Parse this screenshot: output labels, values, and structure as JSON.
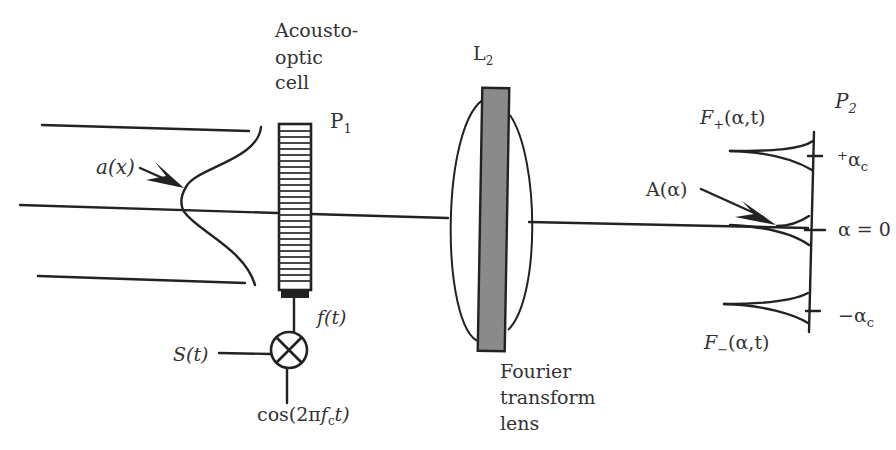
{
  "diagram": {
    "type": "optical-signal-processing-schematic",
    "labels": {
      "cell_line1": "Acousto-",
      "cell_line2": "optic",
      "cell_line3": "cell",
      "p1": "P",
      "p1_sub": "1",
      "ax": "a(x)",
      "ft": "f(t)",
      "st": "S(t)",
      "cos_pre": "cos(2π",
      "cos_f": "f",
      "cos_sub": "c",
      "cos_post": "t)",
      "l2": "L",
      "l2_sub": "2",
      "lens_line1": "Fourier",
      "lens_line2": "transform",
      "lens_line3": "lens",
      "p2": "P",
      "p2_sub": "2",
      "fplus": "F",
      "fplus_sub": "+",
      "fplus_args": "(α,t)",
      "fminus": "F",
      "fminus_sub": "−",
      "fminus_args": "(α,t)",
      "aalpha": "A(α)",
      "plus_ac_sign": "+",
      "plus_ac": "α",
      "plus_ac_sub": "c",
      "zero": "α = 0",
      "minus_ac": "−α",
      "minus_ac_sub": "c"
    },
    "components": [
      {
        "id": "input-beam",
        "kind": "collimated beam with Gaussian profile a(x)"
      },
      {
        "id": "acousto-optic-cell",
        "plane": "P1"
      },
      {
        "id": "mixer",
        "inputs": [
          "S(t)",
          "cos(2πf_c t)"
        ],
        "output": "f(t)"
      },
      {
        "id": "fourier-lens",
        "name": "L2"
      },
      {
        "id": "output-plane",
        "plane": "P2",
        "marks": [
          "+α_c",
          "α = 0",
          "−α_c"
        ]
      }
    ]
  }
}
